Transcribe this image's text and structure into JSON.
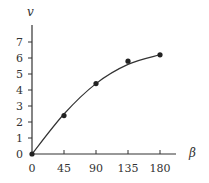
{
  "chart_data": {
    "type": "line",
    "title": "",
    "xlabel": "β",
    "ylabel": "v",
    "x_ticks": [
      0,
      45,
      90,
      135,
      180
    ],
    "y_ticks": [
      0,
      1,
      2,
      3,
      4,
      5,
      6,
      7
    ],
    "xlim": [
      0,
      200
    ],
    "ylim": [
      0,
      8
    ],
    "grid": false,
    "legend": null,
    "series": [
      {
        "name": "measured",
        "style": "markers",
        "x": [
          0,
          45,
          90,
          135,
          180
        ],
        "y": [
          0,
          2.4,
          4.4,
          5.8,
          6.2
        ]
      },
      {
        "name": "fit curve",
        "style": "smooth-line",
        "x": [
          0,
          45,
          90,
          135,
          180
        ],
        "y": [
          0,
          2.5,
          4.4,
          5.6,
          6.2
        ]
      }
    ]
  },
  "colors": {
    "axis": "#333333",
    "line": "#333333",
    "marker": "#222222"
  },
  "labels": {
    "x_axis": "β",
    "y_axis": "v"
  }
}
